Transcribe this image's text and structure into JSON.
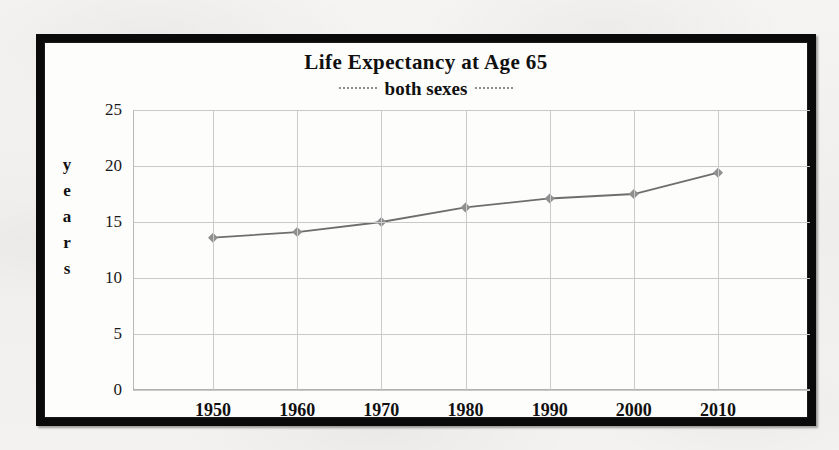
{
  "chart_data": {
    "type": "line",
    "title": "Life Expectancy at Age 65",
    "legend": "both sexes",
    "legend_position": "below-title",
    "xlabel": "",
    "ylabel": "years",
    "ylabel_letters": [
      "y",
      "e",
      "a",
      "r",
      "s"
    ],
    "categories": [
      "1950",
      "1960",
      "1970",
      "1980",
      "1990",
      "2000",
      "2010"
    ],
    "x": [
      1950,
      1960,
      1970,
      1980,
      1990,
      2000,
      2010
    ],
    "values": [
      13.6,
      14.1,
      15.0,
      16.3,
      17.1,
      17.5,
      19.4
    ],
    "series": [
      {
        "name": "both sexes",
        "values": [
          13.6,
          14.1,
          15.0,
          16.3,
          17.1,
          17.5,
          19.4
        ]
      }
    ],
    "ylim": [
      0,
      25
    ],
    "yticks": [
      0,
      5,
      10,
      15,
      20,
      25
    ],
    "ytick_labels": [
      "0",
      "5",
      "10",
      "15",
      "20",
      "25"
    ],
    "xtick_labels": [
      "1950",
      "1960",
      "1970",
      "1980",
      "1990",
      "2000",
      "2010"
    ],
    "grid": true,
    "marker": "diamond",
    "line_color": "#6e6e6e",
    "marker_color": "#8f8f8f",
    "grid_color": "#c9c9c9",
    "frame_color": "#0a0a0a",
    "background": "#fdfdfc"
  }
}
